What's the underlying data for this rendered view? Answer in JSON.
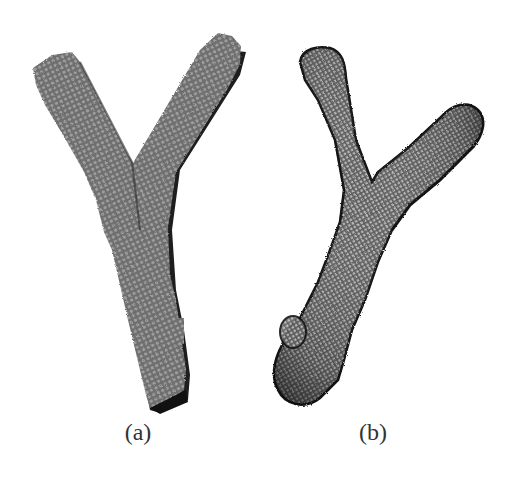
{
  "figure": {
    "panels": [
      {
        "id": "a",
        "label": "(a)",
        "description": "Voxel model of Y-shaped branching structure",
        "fill_color": "#7a7a7a",
        "dot_color": "#9a9a9a",
        "shadow_color": "#1e1e1e"
      },
      {
        "id": "b",
        "label": "(b)",
        "description": "Smoothed surface mesh of Y-shaped branching structure",
        "fill_color": "#6a6a6a",
        "mesh_color": "#bdbdbd",
        "edge_color": "#141414"
      }
    ]
  }
}
